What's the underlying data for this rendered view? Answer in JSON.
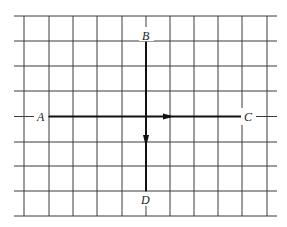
{
  "diagram": {
    "type": "grid-vector-diagram",
    "grid": {
      "rows": 8,
      "cols": 10,
      "line_color": "#3a3a3a"
    },
    "points": [
      {
        "label": "A",
        "position": "left"
      },
      {
        "label": "B",
        "position": "top"
      },
      {
        "label": "C",
        "position": "right"
      },
      {
        "label": "D",
        "position": "bottom"
      }
    ],
    "segments": [
      {
        "from": "A",
        "to": "C",
        "arrow_direction": "toward C"
      },
      {
        "from": "B",
        "to": "D",
        "arrow_direction": "toward D"
      }
    ],
    "labels": {
      "A": "A",
      "B": "B",
      "C": "C",
      "D": "D"
    },
    "stroke_color": "#111111"
  }
}
